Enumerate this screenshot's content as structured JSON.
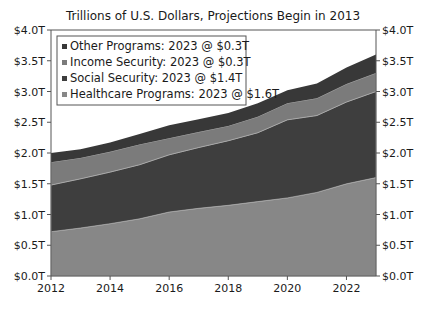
{
  "chart_data": {
    "type": "area",
    "stacked": true,
    "title": "Trillions of U.S. Dollars, Projections Begin in 2013",
    "xlabel": "",
    "ylabel": "",
    "x": [
      2012,
      2013,
      2014,
      2015,
      2016,
      2017,
      2018,
      2019,
      2020,
      2021,
      2022,
      2023
    ],
    "xlim": [
      2012,
      2023
    ],
    "ylim": [
      0,
      4.0
    ],
    "x_ticks": [
      "2012",
      "2014",
      "2016",
      "2018",
      "2020",
      "2022"
    ],
    "y_ticks": [
      "$0.0T",
      "$0.5T",
      "$1.0T",
      "$1.5T",
      "$2.0T",
      "$2.5T",
      "$3.0T",
      "$3.5T",
      "$4.0T"
    ],
    "y_ticks_right": [
      "$0.0T",
      "$0.5T",
      "$1.0T",
      "$1.5T",
      "$2.0T",
      "$2.5T",
      "$3.0T",
      "$3.5T",
      "$4.0T"
    ],
    "grid": false,
    "legend_position": "upper left",
    "series": [
      {
        "name": "Healthcare Programs",
        "legend_label": "Healthcare Programs: 2023 @ $1.6T",
        "color": "#878787",
        "values": [
          0.72,
          0.78,
          0.85,
          0.93,
          1.04,
          1.1,
          1.15,
          1.21,
          1.27,
          1.36,
          1.5,
          1.6
        ]
      },
      {
        "name": "Social Security",
        "legend_label": "Social Security: 2023 @ $1.4T",
        "color": "#3e3e3e",
        "values": [
          0.76,
          0.8,
          0.84,
          0.88,
          0.93,
          0.99,
          1.05,
          1.12,
          1.27,
          1.25,
          1.33,
          1.4
        ]
      },
      {
        "name": "Income Security",
        "legend_label": "Income Security: 2023 @ $0.3T",
        "color": "#7b7b7b",
        "values": [
          0.37,
          0.34,
          0.33,
          0.33,
          0.27,
          0.25,
          0.24,
          0.26,
          0.27,
          0.28,
          0.29,
          0.3
        ]
      },
      {
        "name": "Other Programs",
        "legend_label": "Other Programs: 2023 @ $0.3T",
        "color": "#383838",
        "values": [
          0.15,
          0.14,
          0.15,
          0.17,
          0.21,
          0.21,
          0.21,
          0.22,
          0.21,
          0.24,
          0.27,
          0.3
        ]
      }
    ],
    "legend_order": [
      "Other Programs",
      "Income Security",
      "Social Security",
      "Healthcare Programs"
    ]
  }
}
